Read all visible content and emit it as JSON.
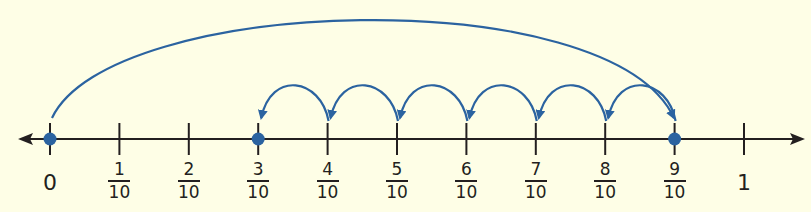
{
  "number_line": {
    "min": 0,
    "max": 1,
    "step": "1/10",
    "colors": {
      "background": "#fefee6",
      "line": "#231f20",
      "accent": "#2b63a0"
    },
    "ticks": [
      {
        "value": 0,
        "label_type": "whole",
        "label": "0"
      },
      {
        "value": 0.1,
        "label_type": "fraction",
        "numerator": "1",
        "denominator": "10"
      },
      {
        "value": 0.2,
        "label_type": "fraction",
        "numerator": "2",
        "denominator": "10"
      },
      {
        "value": 0.3,
        "label_type": "fraction",
        "numerator": "3",
        "denominator": "10"
      },
      {
        "value": 0.4,
        "label_type": "fraction",
        "numerator": "4",
        "denominator": "10"
      },
      {
        "value": 0.5,
        "label_type": "fraction",
        "numerator": "5",
        "denominator": "10"
      },
      {
        "value": 0.6,
        "label_type": "fraction",
        "numerator": "6",
        "denominator": "10"
      },
      {
        "value": 0.7,
        "label_type": "fraction",
        "numerator": "7",
        "denominator": "10"
      },
      {
        "value": 0.8,
        "label_type": "fraction",
        "numerator": "8",
        "denominator": "10"
      },
      {
        "value": 0.9,
        "label_type": "fraction",
        "numerator": "9",
        "denominator": "10"
      },
      {
        "value": 1,
        "label_type": "whole",
        "label": "1"
      }
    ],
    "points": [
      {
        "value": 0,
        "label": "0"
      },
      {
        "value": 0.3,
        "label": "3/10"
      },
      {
        "value": 0.9,
        "label": "9/10"
      }
    ],
    "jumps": [
      {
        "from": "0",
        "to": "9/10",
        "direction": "forward",
        "size": "9/10"
      },
      {
        "from": "9/10",
        "to": "8/10",
        "direction": "backward",
        "size": "1/10"
      },
      {
        "from": "8/10",
        "to": "7/10",
        "direction": "backward",
        "size": "1/10"
      },
      {
        "from": "7/10",
        "to": "6/10",
        "direction": "backward",
        "size": "1/10"
      },
      {
        "from": "6/10",
        "to": "5/10",
        "direction": "backward",
        "size": "1/10"
      },
      {
        "from": "5/10",
        "to": "4/10",
        "direction": "backward",
        "size": "1/10"
      },
      {
        "from": "4/10",
        "to": "3/10",
        "direction": "backward",
        "size": "1/10"
      }
    ]
  }
}
